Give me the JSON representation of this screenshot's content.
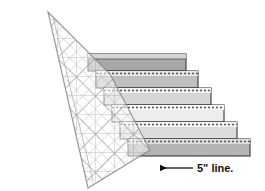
{
  "figure": {
    "background_color": "#ffffff"
  },
  "annotation": {
    "text": "5\" line.",
    "arrow": "left-arrow-icon",
    "x": 196,
    "y": 173,
    "arrow_from_x": 193,
    "arrow_to_x": 160,
    "arrow_y": 168,
    "color": "#111111"
  },
  "ruler": {
    "name": "quilting-ruler",
    "angle_deg": 45,
    "fill_color": "#fbfbfb",
    "edge_color": "#8a8a8a",
    "grid_color": "#b9b9b9",
    "major_grid_color": "#888888",
    "opacity": 0.82,
    "corners": [
      [
        48,
        12
      ],
      [
        110,
        74
      ],
      [
        150,
        150
      ],
      [
        88,
        188
      ]
    ]
  },
  "strips": [
    {
      "name": "strip-1",
      "fill": "#a8a8a8",
      "top_edge_fill": "#d8d8d8",
      "left": 88,
      "top": 54,
      "right": 186,
      "height": 17,
      "seam": "dashed-seam-line",
      "seam_visible": false
    },
    {
      "name": "strip-2",
      "fill": "#bfbfbf",
      "top_edge_fill": "#e6e6e6",
      "left": 96,
      "top": 71,
      "right": 198,
      "height": 17,
      "seam": "dashed-seam-line",
      "seam_visible": true
    },
    {
      "name": "strip-3",
      "fill": "#d6d6d6",
      "top_edge_fill": "#f0f0f0",
      "left": 104,
      "top": 88,
      "right": 211,
      "height": 17,
      "seam": "dashed-seam-line",
      "seam_visible": true
    },
    {
      "name": "strip-4",
      "fill": "#ededed",
      "top_edge_fill": "#fafafa",
      "left": 112,
      "top": 105,
      "right": 224,
      "height": 17,
      "seam": "dashed-seam-line",
      "seam_visible": true
    },
    {
      "name": "strip-5",
      "fill": "#dcdcdc",
      "top_edge_fill": "#f4f4f4",
      "left": 120,
      "top": 122,
      "right": 237,
      "height": 17,
      "seam": "dashed-seam-line",
      "seam_visible": true
    },
    {
      "name": "strip-6",
      "fill": "#b4b4b4",
      "top_edge_fill": "#dddddd",
      "left": 128,
      "top": 139,
      "right": 250,
      "height": 17,
      "seam": "dashed-seam-line",
      "seam_visible": true
    }
  ],
  "strip_style": {
    "outline_color": "#3a3a3a",
    "seam_color": "#555555",
    "seam_dash": "2 2"
  }
}
